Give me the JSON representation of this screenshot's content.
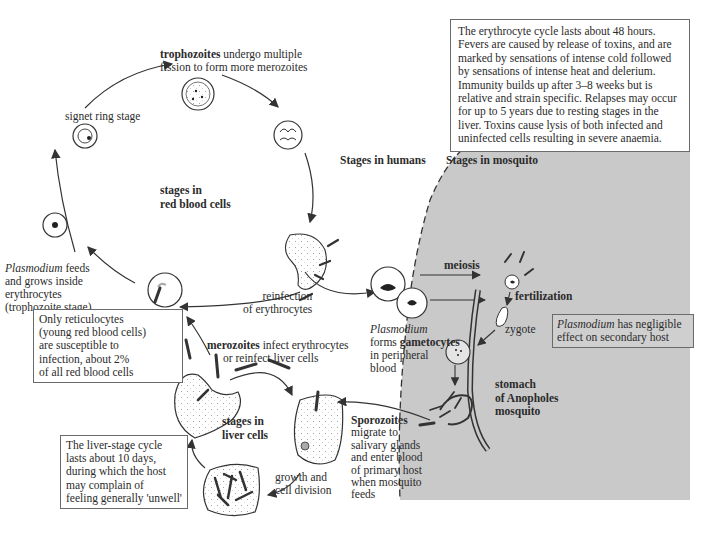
{
  "colors": {
    "mosquito_region": "#c9c9c9",
    "line": "#333333",
    "box_border": "#6a6a6a"
  },
  "info_box": {
    "text": "The erythrocyte cycle lasts about 48 hours. Fevers are caused by release of toxins, and are marked by sensations of intense cold followed by sensations of intense heat and delerium. Immunity builds up after 3–8 weeks but is relative and strain specific. Relapses may occur for up to 5 years due to resting stages in the liver. Toxins cause lysis of both infected and uninfected cells resulting in severe anaemia."
  },
  "regions": {
    "humans": "Stages in humans",
    "mosquito": "Stages in mosquito"
  },
  "rbc_cycle": {
    "center_label_line1": "stages in",
    "center_label_line2": "red blood cells",
    "trophozoites_bold": "trophozoites",
    "trophozoites_rest_line1": " undergo multiple",
    "trophozoites_rest_line2": "fission to form more merozoites",
    "signet_ring": "signet ring stage",
    "feeds_italic": "Plasmodium",
    "feeds_line1": " feeds",
    "feeds_line2": "and grows inside",
    "feeds_line3": "erythrocytes",
    "feeds_line4": "(trophozoite stage)",
    "reinfection_line1": "reinfection",
    "reinfection_line2": "of erythrocytes"
  },
  "reticulocyte_box": {
    "lines": [
      "Only reticulocytes",
      "(young red blood cells)",
      "are susceptible to",
      "infection, about 2%",
      "of all red blood cells"
    ]
  },
  "gametocytes": {
    "italic": "Plasmodium",
    "line2_pre": "forms ",
    "line2_bold": "gametocytes",
    "line3": "in peripheral",
    "line4": "blood"
  },
  "liver_cycle": {
    "merozoites_bold": "merozoites",
    "merozoites_rest_line1": " infect erythrocytes",
    "merozoites_line2": "or reinfect liver cells",
    "center_label_line1": "stages in",
    "center_label_line2": "liver cells",
    "growth_line1": "growth and",
    "growth_line2": "cell division"
  },
  "liver_box": {
    "lines": [
      "The liver-stage cycle",
      "lasts about 10 days,",
      "during which the host",
      "may complain of",
      "feeling generally 'unwell'"
    ]
  },
  "sporozoites": {
    "bold": "Sporozoites",
    "lines": [
      "migrate to",
      "salivary glands",
      "and enter blood",
      "of primary host",
      "when mosquito",
      "feeds"
    ]
  },
  "mosquito_stages": {
    "meiosis": "meiosis",
    "fertilization": "fertilization",
    "zygote": "zygote",
    "stomach_line1": "stomach",
    "stomach_line2": "of Anopholes",
    "stomach_line3": "mosquito"
  },
  "secondary_host_box": {
    "italic": "Plasmodium",
    "line1_rest": " has negligible",
    "line2": "effect on secondary host"
  }
}
